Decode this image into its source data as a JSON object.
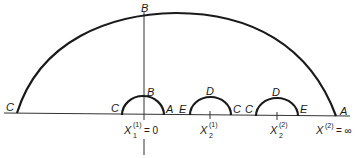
{
  "diagram": {
    "colors": {
      "stroke": "#1a1a1a",
      "background": "#ffffff"
    },
    "large_arc": {
      "left_label": "C",
      "top_label": "B",
      "right_label": "A"
    },
    "semicircle_1": {
      "left_label": "C",
      "top_label": "B",
      "right_label": "A"
    },
    "semicircle_2": {
      "left_label": "E",
      "top_label": "D",
      "right_label": "C"
    },
    "semicircle_3": {
      "left_label": "C",
      "top_label": "D",
      "right_label": "E"
    },
    "axis_labels": {
      "x1_1": {
        "base": "X",
        "sup": "(1)",
        "sub": "1",
        "suffix": "= 0"
      },
      "x2_1": {
        "base": "X",
        "sup": "(1)",
        "sub": "2"
      },
      "x2_2": {
        "base": "X",
        "sup": "(2)",
        "sub": "2"
      },
      "x_inf": {
        "base": "X",
        "sup": "(2)",
        "suffix": "= ∞"
      }
    }
  }
}
